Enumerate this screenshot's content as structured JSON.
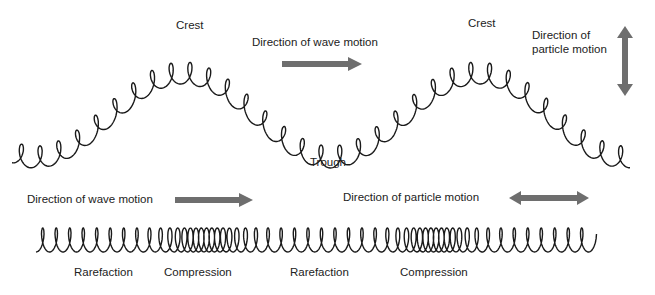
{
  "transverse": {
    "crest_left": "Crest",
    "crest_right": "Crest",
    "trough": "Trough",
    "wave_direction": "Direction of wave motion",
    "particle_direction_line1": "Direction of",
    "particle_direction_line2": "particle motion"
  },
  "longitudinal": {
    "wave_direction": "Direction of wave motion",
    "particle_direction": "Direction of particle motion",
    "labels": [
      "Rarefaction",
      "Compression",
      "Rarefaction",
      "Compression"
    ]
  },
  "colors": {
    "line": "#1a1a1a",
    "arrow": "#6e6e6e",
    "text": "#222222"
  },
  "icons": {
    "wave_arrow": "right-arrow",
    "transverse_particle_arrow": "up-down-arrow",
    "longitudinal_wave_arrow": "right-arrow",
    "longitudinal_particle_arrow": "left-right-arrow"
  }
}
